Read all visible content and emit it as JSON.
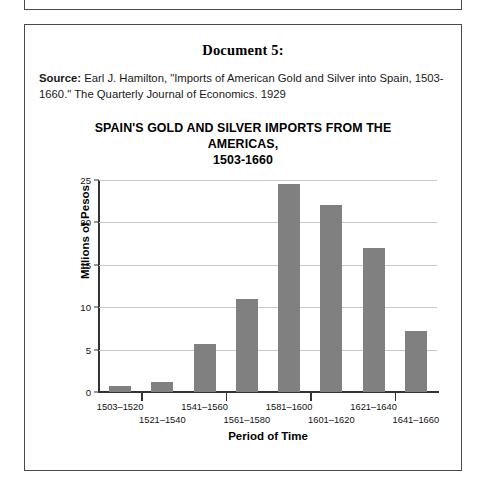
{
  "document": {
    "heading": "Document 5:",
    "source_label": "Source:",
    "source_text": " Earl J. Hamilton, \"Imports of American Gold and Silver into Spain, 1503-1660.\" The Quarterly Journal of Economics. 1929"
  },
  "chart_data": {
    "type": "bar",
    "title": "SPAIN'S GOLD AND SILVER IMPORTS FROM THE AMERICAS, 1503-1660",
    "title_line1": "SPAIN'S GOLD AND SILVER IMPORTS FROM THE AMERICAS,",
    "title_line2": "1503-1660",
    "xlabel": "Period of Time",
    "ylabel": "Millions of Pesos",
    "categories": [
      "1503–1520",
      "1521–1540",
      "1541–1560",
      "1561–1580",
      "1581–1600",
      "1601–1620",
      "1621–1640",
      "1641–1660"
    ],
    "values": [
      0.7,
      1.2,
      5.7,
      11.0,
      24.5,
      22.0,
      17.0,
      7.2
    ],
    "ylim": [
      0,
      25
    ],
    "yticks": [
      0,
      5,
      10,
      15,
      20,
      25
    ],
    "ytick_labels": [
      "0",
      "5",
      "10",
      "15",
      "20",
      "25"
    ],
    "grid": true,
    "legend": "none",
    "bar_color": "#808080",
    "axis_color": "#333333",
    "gridline_color": "#c8c8c8"
  }
}
